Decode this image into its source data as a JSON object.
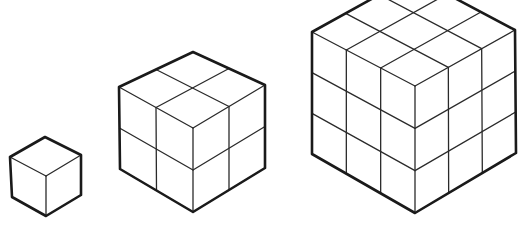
{
  "figure": {
    "background": "#ffffff",
    "stroke_color": "#1a1a1a",
    "cubes": [
      {
        "name": "cube-1x1x1",
        "divisions": 1,
        "vertices": {
          "top": [
            45,
            137
          ],
          "left_top": [
            10,
            157
          ],
          "right_top": [
            81,
            155
          ],
          "center": [
            46,
            176
          ],
          "left_bottom": [
            12,
            197
          ],
          "right_bottom": [
            81,
            195
          ],
          "bottom": [
            46,
            216
          ]
        }
      },
      {
        "name": "cube-2x2x2",
        "divisions": 2,
        "vertices": {
          "top": [
            193,
            52
          ],
          "left_top": [
            119,
            87
          ],
          "right_top": [
            265,
            85
          ],
          "center": [
            193,
            128
          ],
          "left_bottom": [
            120,
            169
          ],
          "right_bottom": [
            265,
            168
          ],
          "bottom": [
            193,
            212
          ]
        }
      },
      {
        "name": "cube-3x3x3",
        "divisions": 3,
        "vertices": {
          "top": [
            413,
            -24
          ],
          "left_top": [
            312,
            32
          ],
          "right_top": [
            515,
            30
          ],
          "center": [
            415,
            86
          ],
          "left_bottom": [
            312,
            154
          ],
          "right_bottom": [
            516,
            153
          ],
          "bottom": [
            415,
            213
          ]
        }
      }
    ]
  }
}
